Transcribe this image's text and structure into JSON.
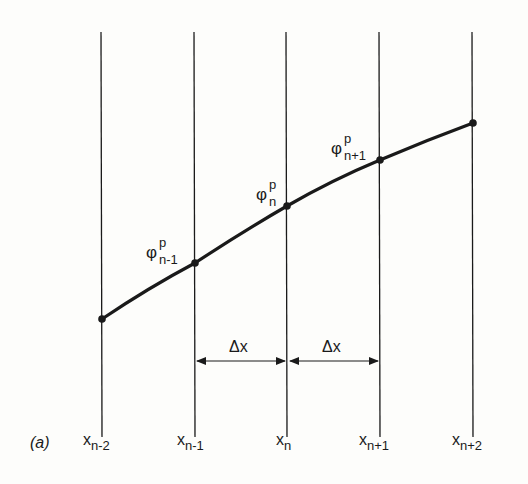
{
  "figure": {
    "panel_label": "(a)",
    "grid_labels": [
      {
        "base": "x",
        "sub": "n-2"
      },
      {
        "base": "x",
        "sub": "n-1"
      },
      {
        "base": "x",
        "sub": "n"
      },
      {
        "base": "x",
        "sub": "n+1"
      },
      {
        "base": "x",
        "sub": "n+2"
      }
    ],
    "point_labels": [
      {
        "base": "φ",
        "sup": "p",
        "sub": "n-1"
      },
      {
        "base": "φ",
        "sup": "p",
        "sub": "n"
      },
      {
        "base": "φ",
        "sup": "p",
        "sub": "n+1"
      }
    ],
    "spacing_labels": [
      "Δx",
      "Δx"
    ],
    "line_color": "#1a1a1a"
  }
}
